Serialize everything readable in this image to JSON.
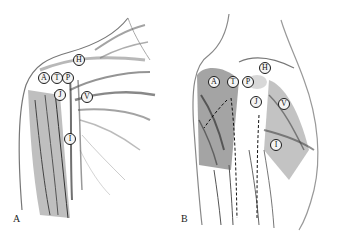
{
  "figure": {
    "panels": [
      {
        "id": "A",
        "letter": "A",
        "markers": [
          {
            "label": "H",
            "x": 73,
            "y": 54
          },
          {
            "label": "A",
            "x": 38,
            "y": 72
          },
          {
            "label": "T",
            "x": 51,
            "y": 72
          },
          {
            "label": "P",
            "x": 62,
            "y": 72
          },
          {
            "label": "J",
            "x": 54,
            "y": 89
          },
          {
            "label": "V",
            "x": 81,
            "y": 91
          },
          {
            "label": "I",
            "x": 64,
            "y": 133
          }
        ]
      },
      {
        "id": "B",
        "letter": "B",
        "markers": [
          {
            "label": "H",
            "x": 90,
            "y": 62
          },
          {
            "label": "A",
            "x": 39,
            "y": 76
          },
          {
            "label": "T",
            "x": 58,
            "y": 76
          },
          {
            "label": "P",
            "x": 73,
            "y": 76
          },
          {
            "label": "J",
            "x": 81,
            "y": 96
          },
          {
            "label": "V",
            "x": 109,
            "y": 98
          },
          {
            "label": "I",
            "x": 101,
            "y": 139
          }
        ]
      }
    ]
  }
}
